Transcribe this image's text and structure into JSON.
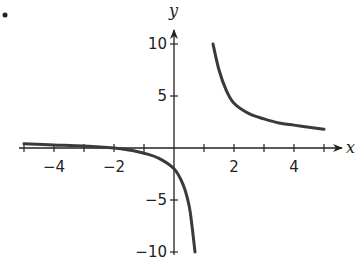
{
  "bullet": "•",
  "chart_data": {
    "type": "line",
    "title": "",
    "xlabel": "x",
    "ylabel": "y",
    "xlim": [
      -5,
      5.5
    ],
    "ylim": [
      -10,
      11
    ],
    "grid": false,
    "legend": null,
    "x_tick_labels": [
      "-4",
      "-2",
      "2",
      "4"
    ],
    "y_tick_labels": [
      "10",
      "5",
      "-5",
      "-10"
    ],
    "x_ticks": [
      -5,
      -4,
      -3,
      -2,
      -1,
      1,
      2,
      3,
      4,
      5
    ],
    "y_ticks": [
      -10,
      -5,
      5,
      10
    ],
    "vertical_asymptote": 1,
    "horizontal_asymptote": 1,
    "series": [
      {
        "name": "left branch",
        "x": [
          -5,
          -4,
          -3,
          -2,
          -1.5,
          -1,
          -0.5,
          0,
          0.3,
          0.5,
          0.6,
          0.7
        ],
        "y": [
          0.4,
          0.3,
          0.2,
          0,
          -0.2,
          -0.5,
          -1.0,
          -2.0,
          -3.5,
          -5.5,
          -7.5,
          -10
        ]
      },
      {
        "name": "right branch",
        "x": [
          1.3,
          1.5,
          1.75,
          2,
          2.5,
          3,
          3.5,
          4,
          4.5,
          5
        ],
        "y": [
          10,
          7.5,
          5.5,
          4.3,
          3.3,
          2.8,
          2.4,
          2.2,
          2.0,
          1.8
        ]
      }
    ]
  },
  "labels": {
    "x_axis": "x",
    "y_axis": "y",
    "xt": [
      "−4",
      "−2",
      "2",
      "4"
    ],
    "yt": [
      "10",
      "5",
      "−5",
      "−10"
    ]
  }
}
